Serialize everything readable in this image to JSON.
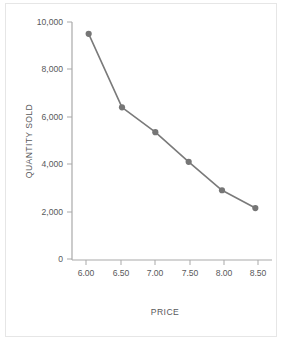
{
  "chart_data": {
    "type": "line",
    "title": "",
    "subtitle": "",
    "xlabel": "PRICE",
    "ylabel": "QUANTITY SOLD",
    "x": [
      6.0,
      6.5,
      7.0,
      7.5,
      8.0,
      8.5
    ],
    "values": [
      9500,
      6400,
      5350,
      4100,
      2900,
      2150
    ],
    "series": [
      {
        "name": "Quantity sold",
        "values": [
          9500,
          6400,
          5350,
          4100,
          2900,
          2150
        ]
      }
    ],
    "xtick_labels": [
      "6.00",
      "6.50",
      "7.00",
      "7.50",
      "8.00",
      "8.50"
    ],
    "ytick_labels": [
      "0",
      "2,000",
      "4,000",
      "6,000",
      "8,000",
      "10,000"
    ],
    "ytick_values": [
      0,
      2000,
      4000,
      6000,
      8000,
      10000
    ],
    "xlim": [
      5.75,
      8.75
    ],
    "ylim": [
      0,
      10000
    ],
    "grid": false,
    "legend": false,
    "legend_position": "none",
    "marker": "circle",
    "line_color": "#7a7a7a",
    "marker_color": "#767676",
    "axis_color": "#a9a9a9",
    "text_color": "#58595b",
    "background_color": "#ffffff",
    "border_color": "#e6e6e6"
  }
}
